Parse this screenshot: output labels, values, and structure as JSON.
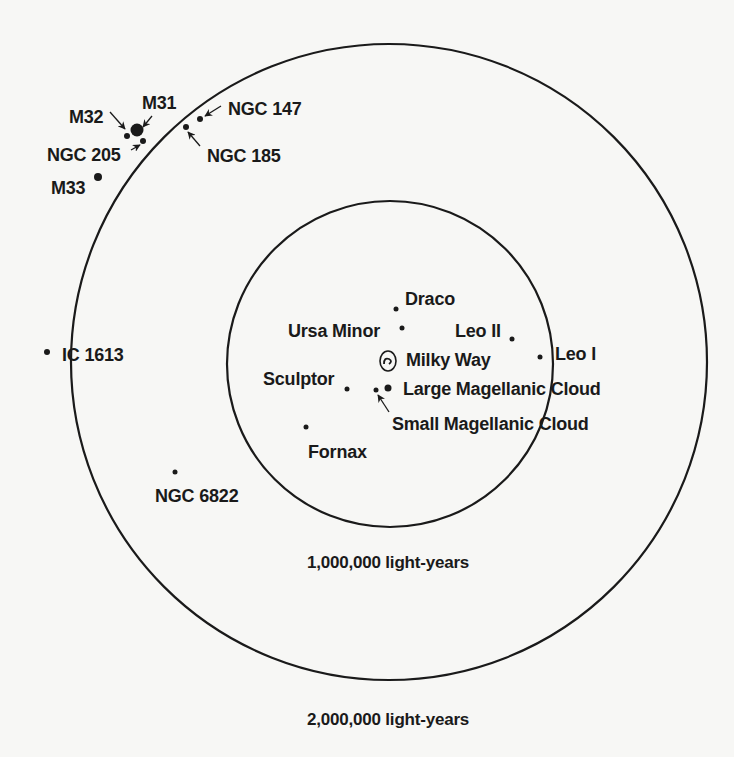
{
  "diagram": {
    "style": {
      "ink": "#1a1a1a",
      "background": "#f7f7f5"
    },
    "rings": [
      {
        "id": "inner",
        "cx": 390,
        "cy": 364,
        "r": 163,
        "label": "1,000,000 light-years",
        "label_x": 388,
        "label_y": 554
      },
      {
        "id": "outer",
        "cx": 389,
        "cy": 362,
        "r": 318,
        "label": "2,000,000 light-years",
        "label_x": 388,
        "label_y": 711
      }
    ],
    "galaxies": [
      {
        "name": "M31",
        "x": 137,
        "y": 130,
        "r": 6.5,
        "label": "M31",
        "lx": 142,
        "ly": 94,
        "anchor": "start"
      },
      {
        "name": "M32",
        "x": 127,
        "y": 136,
        "r": 3,
        "label": "M32",
        "lx": 69,
        "ly": 108,
        "anchor": "start"
      },
      {
        "name": "NGC 205",
        "x": 143,
        "y": 141,
        "r": 3,
        "label": "NGC 205",
        "lx": 47,
        "ly": 146,
        "anchor": "start"
      },
      {
        "name": "M33",
        "x": 98,
        "y": 177,
        "r": 4,
        "label": "M33",
        "lx": 51,
        "ly": 179,
        "anchor": "start"
      },
      {
        "name": "NGC 147",
        "x": 200,
        "y": 119,
        "r": 3,
        "label": "NGC 147",
        "lx": 228,
        "ly": 100,
        "anchor": "start"
      },
      {
        "name": "NGC 185",
        "x": 186,
        "y": 127,
        "r": 3,
        "label": "NGC 185",
        "lx": 207,
        "ly": 147,
        "anchor": "start"
      },
      {
        "name": "IC 1613",
        "x": 47,
        "y": 352,
        "r": 3,
        "label": "IC 1613",
        "lx": 62,
        "ly": 346,
        "anchor": "start"
      },
      {
        "name": "NGC 6822",
        "x": 175,
        "y": 472,
        "r": 2.5,
        "label": "NGC 6822",
        "lx": 155,
        "ly": 487,
        "anchor": "start"
      },
      {
        "name": "Draco",
        "x": 396,
        "y": 309,
        "r": 2.5,
        "label": "Draco",
        "lx": 405,
        "ly": 290,
        "anchor": "start"
      },
      {
        "name": "Ursa Minor",
        "x": 402,
        "y": 328,
        "r": 2.5,
        "label": "Ursa Minor",
        "lx": 288,
        "ly": 322,
        "anchor": "start"
      },
      {
        "name": "Leo II",
        "x": 512,
        "y": 339,
        "r": 2.5,
        "label": "Leo II",
        "lx": 455,
        "ly": 322,
        "anchor": "start"
      },
      {
        "name": "Leo I",
        "x": 540,
        "y": 357,
        "r": 2.5,
        "label": "Leo I",
        "lx": 555,
        "ly": 345,
        "anchor": "start"
      },
      {
        "name": "Sculptor",
        "x": 347,
        "y": 389,
        "r": 2.5,
        "label": "Sculptor",
        "lx": 263,
        "ly": 370,
        "anchor": "start"
      },
      {
        "name": "Small Magellanic Cloud",
        "x": 376,
        "y": 390,
        "r": 2.5,
        "label": "Small Magellanic Cloud",
        "lx": 392,
        "ly": 415,
        "anchor": "start"
      },
      {
        "name": "Large Magellanic Cloud",
        "x": 388,
        "y": 388,
        "r": 3.5,
        "label": "Large Magellanic Cloud",
        "lx": 403,
        "ly": 380,
        "anchor": "start"
      },
      {
        "name": "Fornax",
        "x": 306,
        "y": 427,
        "r": 2.5,
        "label": "Fornax",
        "lx": 308,
        "ly": 443,
        "anchor": "start"
      }
    ],
    "milky_way": {
      "name": "Milky Way",
      "x": 388,
      "y": 361,
      "label": "Milky Way",
      "lx": 406,
      "ly": 351
    },
    "arrows": [
      {
        "for": "M32",
        "x1": 110,
        "y1": 112,
        "x2": 125,
        "y2": 129
      },
      {
        "for": "M31",
        "x1": 152,
        "y1": 116,
        "x2": 143,
        "y2": 127
      },
      {
        "for": "NGC 205",
        "x1": 131,
        "y1": 150,
        "x2": 140,
        "y2": 145
      },
      {
        "for": "NGC 147",
        "x1": 221,
        "y1": 106,
        "x2": 205,
        "y2": 116
      },
      {
        "for": "NGC 185",
        "x1": 200,
        "y1": 146,
        "x2": 188,
        "y2": 132
      },
      {
        "for": "Small Magellanic Cloud",
        "x1": 389,
        "y1": 412,
        "x2": 378,
        "y2": 395
      }
    ]
  }
}
